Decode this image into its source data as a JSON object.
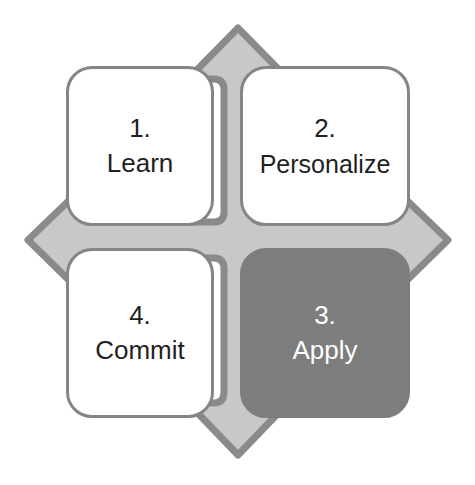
{
  "diagram": {
    "type": "four-quadrant-cycle",
    "shape": "four-directional-arrow",
    "colors": {
      "background": "#ffffff",
      "arrow_fill": "#c8c8c8",
      "arrow_stroke": "#8a8a8a",
      "box_fill_light": "#ffffff",
      "box_border": "#858585",
      "box_fill_dark": "#7d7d7d",
      "text_dark": "#1f1f1f",
      "text_light": "#ffffff"
    },
    "quadrants": [
      {
        "id": "learn",
        "step": "1.",
        "label": "Learn",
        "position": "top-left",
        "highlighted": false
      },
      {
        "id": "personalize",
        "step": "2.",
        "label": "Personalize",
        "position": "top-right",
        "highlighted": false
      },
      {
        "id": "apply",
        "step": "3.",
        "label": "Apply",
        "position": "bottom-right",
        "highlighted": true
      },
      {
        "id": "commit",
        "step": "4.",
        "label": "Commit",
        "position": "bottom-left",
        "highlighted": false
      }
    ]
  }
}
